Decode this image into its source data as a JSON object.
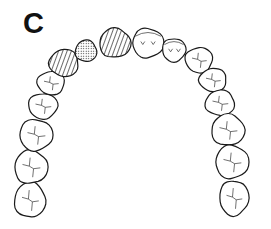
{
  "figure": {
    "panel_label": "C",
    "legend_patterns": {
      "hatched": "diagonal-lines",
      "stippled": "dots",
      "plain": "none"
    },
    "colors": {
      "outline": "#1a1a1a",
      "background": "#ffffff",
      "fill": "#ffffff"
    }
  },
  "teeth": [
    {
      "id": "left-third-molar",
      "pattern": "plain",
      "cx": 30,
      "cy": 200,
      "rx": 16,
      "ry": 18
    },
    {
      "id": "left-second-molar",
      "pattern": "plain",
      "cx": 31,
      "cy": 167,
      "rx": 17,
      "ry": 17
    },
    {
      "id": "left-first-molar",
      "pattern": "plain",
      "cx": 36,
      "cy": 135,
      "rx": 17,
      "ry": 16
    },
    {
      "id": "left-second-premolar",
      "pattern": "plain",
      "cx": 43,
      "cy": 106,
      "rx": 15,
      "ry": 13
    },
    {
      "id": "left-first-premolar",
      "pattern": "plain",
      "cx": 51,
      "cy": 83,
      "rx": 14,
      "ry": 12
    },
    {
      "id": "left-canine",
      "pattern": "hatched",
      "cx": 64,
      "cy": 63,
      "rx": 15,
      "ry": 14
    },
    {
      "id": "left-lateral-incisor",
      "pattern": "stippled",
      "cx": 86,
      "cy": 51,
      "rx": 11,
      "ry": 11
    },
    {
      "id": "left-central-incisor",
      "pattern": "hatched",
      "cx": 115,
      "cy": 43,
      "rx": 16,
      "ry": 15
    },
    {
      "id": "right-central-incisor",
      "pattern": "plain",
      "cx": 148,
      "cy": 43,
      "rx": 16,
      "ry": 15
    },
    {
      "id": "right-lateral-incisor",
      "pattern": "plain",
      "cx": 174,
      "cy": 50,
      "rx": 12,
      "ry": 12
    },
    {
      "id": "right-canine",
      "pattern": "plain",
      "cx": 199,
      "cy": 60,
      "rx": 14,
      "ry": 13
    },
    {
      "id": "right-first-premolar",
      "pattern": "plain",
      "cx": 213,
      "cy": 80,
      "rx": 14,
      "ry": 12
    },
    {
      "id": "right-second-premolar",
      "pattern": "plain",
      "cx": 220,
      "cy": 103,
      "rx": 15,
      "ry": 13
    },
    {
      "id": "right-first-molar",
      "pattern": "plain",
      "cx": 228,
      "cy": 130,
      "rx": 17,
      "ry": 16
    },
    {
      "id": "right-second-molar",
      "pattern": "plain",
      "cx": 232,
      "cy": 162,
      "rx": 17,
      "ry": 17
    },
    {
      "id": "right-third-molar",
      "pattern": "plain",
      "cx": 234,
      "cy": 198,
      "rx": 15,
      "ry": 18
    }
  ]
}
